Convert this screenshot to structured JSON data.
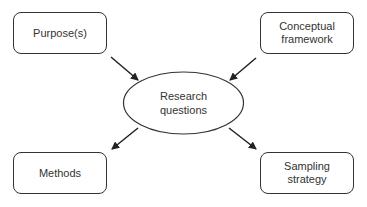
{
  "diagram": {
    "center": {
      "label_line1": "Research",
      "label_line2": "questions"
    },
    "nodes": {
      "purposes": {
        "label": "Purpose(s)"
      },
      "conceptual_framework": {
        "label_line1": "Conceptual",
        "label_line2": "framework"
      },
      "methods": {
        "label": "Methods"
      },
      "sampling_strategy": {
        "label_line1": "Sampling",
        "label_line2": "strategy"
      }
    },
    "edges": [
      {
        "from": "Purpose(s)",
        "to": "Research questions"
      },
      {
        "from": "Conceptual framework",
        "to": "Research questions"
      },
      {
        "from": "Research questions",
        "to": "Methods"
      },
      {
        "from": "Research questions",
        "to": "Sampling strategy"
      }
    ],
    "colors": {
      "stroke": "#333333",
      "text": "#333333",
      "background": "#ffffff"
    }
  }
}
